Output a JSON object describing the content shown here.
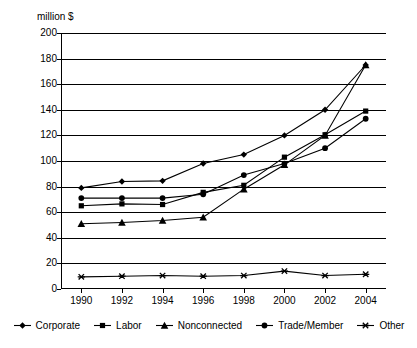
{
  "chart_data": {
    "type": "line",
    "title": "",
    "subtitle": "",
    "xlabel": "",
    "ylabel": "million $",
    "ylim": [
      0,
      200
    ],
    "ytick_step": 20,
    "yticks": [
      200,
      180,
      160,
      140,
      120,
      100,
      80,
      60,
      40,
      20,
      0
    ],
    "grid": true,
    "legend_position": "bottom",
    "categories": [
      "1990",
      "1992",
      "1994",
      "1996",
      "1998",
      "2000",
      "2002",
      "2004"
    ],
    "x": [
      1990,
      1992,
      1994,
      1996,
      1998,
      2000,
      2002,
      2004
    ],
    "series": [
      {
        "name": "Corporate",
        "marker": "diamond",
        "values": [
          79,
          84,
          84.5,
          98,
          105,
          120,
          140,
          175
        ]
      },
      {
        "name": "Labor",
        "marker": "square",
        "values": [
          65,
          66.5,
          66,
          75.5,
          81,
          103,
          120.5,
          139
        ]
      },
      {
        "name": "Nonconnected",
        "marker": "triangle",
        "values": [
          51,
          52,
          53.5,
          56,
          78,
          97,
          120,
          175
        ]
      },
      {
        "name": "Trade/Member",
        "marker": "circle",
        "values": [
          71,
          71,
          71,
          74,
          89,
          98,
          110,
          133
        ]
      },
      {
        "name": "Other",
        "marker": "asterisk",
        "values": [
          9.5,
          10,
          10.5,
          10,
          10.5,
          14,
          10.5,
          11.5
        ]
      }
    ]
  },
  "legend": {
    "items": [
      {
        "label": "Corporate",
        "marker": "diamond"
      },
      {
        "label": "Labor",
        "marker": "square"
      },
      {
        "label": "Nonconnected",
        "marker": "triangle"
      },
      {
        "label": "Trade/Member",
        "marker": "circle"
      },
      {
        "label": "Other",
        "marker": "asterisk"
      }
    ]
  },
  "colors": {
    "series": "#000000",
    "grid": "#000000",
    "axis": "#000000",
    "background": "#ffffff"
  }
}
